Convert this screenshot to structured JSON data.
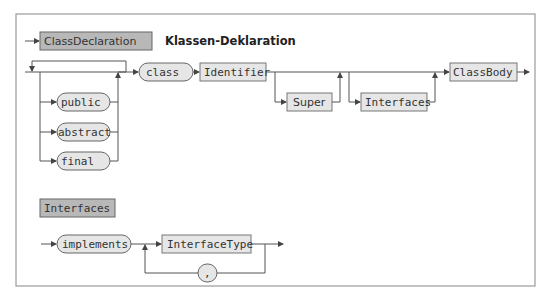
{
  "diagram": {
    "type": "syntax-diagram",
    "rule1": {
      "name": "ClassDeclaration",
      "title": "Klassen-Deklaration",
      "modifiers": [
        "public",
        "abstract",
        "final"
      ],
      "sequence": [
        {
          "kind": "terminal",
          "label": "class"
        },
        {
          "kind": "nonterminal",
          "label": "Identifier"
        },
        {
          "kind": "optional-nonterminal",
          "label": "Super"
        },
        {
          "kind": "optional-nonterminal",
          "label": "Interfaces"
        },
        {
          "kind": "nonterminal",
          "label": "ClassBody"
        }
      ]
    },
    "rule2": {
      "name": "Interfaces",
      "keyword": "implements",
      "item": "InterfaceType",
      "separator": ","
    }
  },
  "colors": {
    "header_fill": "#b8b8b8",
    "box_fill": "#e6e6e6",
    "line": "#555555",
    "frame": "#9a9a9a"
  }
}
